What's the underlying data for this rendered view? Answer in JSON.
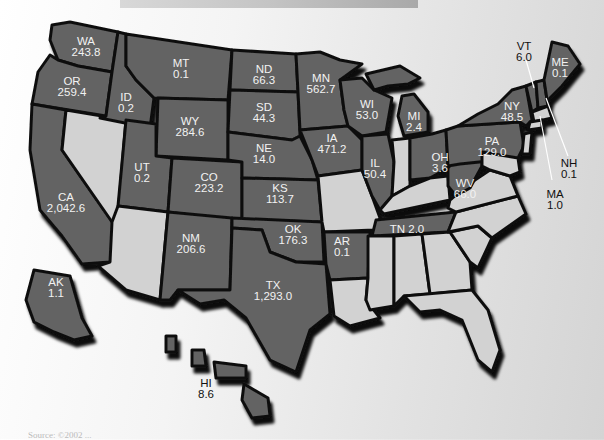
{
  "map": {
    "type": "choropleth-us-states",
    "legend_note": "Shaded states show value; light states have no value shown",
    "colors": {
      "shaded": "#646464",
      "unshaded": "#d2d2d2",
      "border": "#111111",
      "label": "#f2f2f2"
    },
    "states": [
      {
        "abbr": "WA",
        "value": "243.8"
      },
      {
        "abbr": "OR",
        "value": "259.4"
      },
      {
        "abbr": "CA",
        "value": "2,042.6"
      },
      {
        "abbr": "ID",
        "value": "0.2"
      },
      {
        "abbr": "MT",
        "value": "0.1"
      },
      {
        "abbr": "WY",
        "value": "284.6"
      },
      {
        "abbr": "UT",
        "value": "0.2"
      },
      {
        "abbr": "CO",
        "value": "223.2"
      },
      {
        "abbr": "NM",
        "value": "206.6"
      },
      {
        "abbr": "ND",
        "value": "66.3"
      },
      {
        "abbr": "SD",
        "value": "44.3"
      },
      {
        "abbr": "NE",
        "value": "14.0"
      },
      {
        "abbr": "KS",
        "value": "113.7"
      },
      {
        "abbr": "OK",
        "value": "176.3"
      },
      {
        "abbr": "TX",
        "value": "1,293.0"
      },
      {
        "abbr": "MN",
        "value": "562.7"
      },
      {
        "abbr": "IA",
        "value": "471.2"
      },
      {
        "abbr": "AR",
        "value": "0.1"
      },
      {
        "abbr": "WI",
        "value": "53.0"
      },
      {
        "abbr": "IL",
        "value": "50.4"
      },
      {
        "abbr": "MI",
        "value": "2.4"
      },
      {
        "abbr": "OH",
        "value": "3.6"
      },
      {
        "abbr": "TN",
        "value": "2.0"
      },
      {
        "abbr": "WV",
        "value": "66.0"
      },
      {
        "abbr": "PA",
        "value": "129.0"
      },
      {
        "abbr": "NY",
        "value": "48.5"
      },
      {
        "abbr": "VT",
        "value": "6.0"
      },
      {
        "abbr": "ME",
        "value": "0.1"
      },
      {
        "abbr": "NH",
        "value": "0.1"
      },
      {
        "abbr": "MA",
        "value": "1.0"
      },
      {
        "abbr": "AK",
        "value": "1.1"
      },
      {
        "abbr": "HI",
        "value": "8.6"
      }
    ],
    "tn_label": "TN 2.0",
    "source_text": "Source: ©2002 ..."
  }
}
